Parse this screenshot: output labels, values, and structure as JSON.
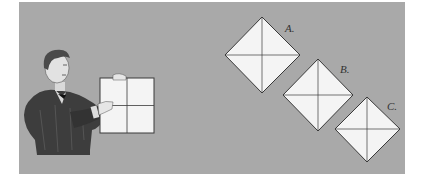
{
  "illustration": {
    "background_color": "#a9a9a9",
    "paper_color": "#f4f4f4",
    "line_color": "#3a3a3a",
    "figure": {
      "description": "Victorian man holding a square sheet of paper folded into quarters"
    },
    "held_square": {
      "crease": "plus (vertical and horizontal folds)"
    },
    "diamonds": [
      {
        "label": "A."
      },
      {
        "label": "B."
      },
      {
        "label": "C."
      }
    ]
  }
}
